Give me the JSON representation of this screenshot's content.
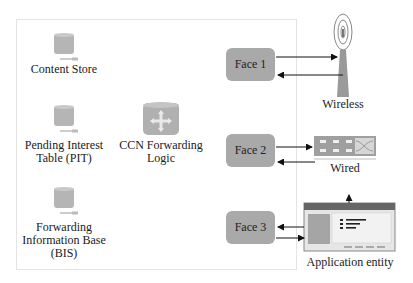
{
  "diagram": {
    "node_components": [
      {
        "id": "cs",
        "label": "Content Store",
        "icon": "database-icon"
      },
      {
        "id": "pit",
        "label_lines": [
          "Pending Interest",
          "Table (PIT)"
        ],
        "icon": "database-icon"
      },
      {
        "id": "fib",
        "label_lines": [
          "Forwarding",
          "Information Base",
          "(BIS)"
        ],
        "icon": "database-icon"
      },
      {
        "id": "logic",
        "label_lines": [
          "CCN Forwarding",
          "Logic"
        ],
        "icon": "router-icon"
      }
    ],
    "faces": [
      {
        "id": "face1",
        "label": "Face 1"
      },
      {
        "id": "face2",
        "label": "Face 2"
      },
      {
        "id": "face3",
        "label": "Face 3"
      }
    ],
    "endpoints": [
      {
        "id": "wireless",
        "label": "Wireless",
        "icon": "antenna-tower-icon"
      },
      {
        "id": "wired",
        "label": "Wired",
        "icon": "network-switch-icon"
      },
      {
        "id": "app",
        "label": "Application entity",
        "icon": "application-window-icon"
      }
    ],
    "colors": {
      "face_fill": "#a9a9a9",
      "icon_fill": "#b5b5b5",
      "frame_border": "#e4e4e4",
      "arrow": "#111111"
    }
  }
}
